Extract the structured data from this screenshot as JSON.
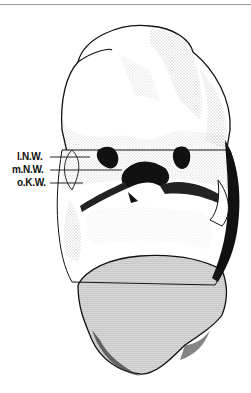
{
  "figure": {
    "labels": [
      {
        "text": "l.N.W.",
        "x": 17,
        "y": 152,
        "line_to": 90
      },
      {
        "text": "m.N.W.",
        "x": 12,
        "y": 165,
        "line_to": 122
      },
      {
        "text": "o.K.W.",
        "x": 17,
        "y": 178,
        "line_to": 83
      }
    ],
    "colors": {
      "ink": "#111111",
      "stipple": "#555555",
      "background": "#ffffff"
    }
  }
}
